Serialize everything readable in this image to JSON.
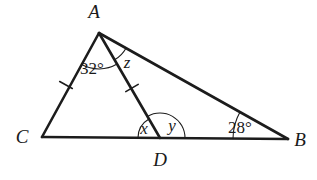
{
  "figure": {
    "type": "geometry-diagram",
    "background_color": "#ffffff",
    "stroke_color": "#1c1c1c",
    "vertices": [
      {
        "id": "A",
        "label": "A",
        "x": 99,
        "y": 33,
        "label_x": 94,
        "label_y": 18
      },
      {
        "id": "C",
        "label": "C",
        "x": 42,
        "y": 137,
        "label_x": 22,
        "label_y": 143
      },
      {
        "id": "D",
        "label": "D",
        "x": 160,
        "y": 138,
        "label_x": 153,
        "label_y": 166
      },
      {
        "id": "B",
        "label": "B",
        "x": 288,
        "y": 139,
        "label_x": 297,
        "label_y": 146
      }
    ],
    "segments": [
      {
        "id": "CA",
        "from": "C",
        "to": "A",
        "stroke_width": 2.6,
        "tick_marks": 1
      },
      {
        "id": "AD",
        "from": "A",
        "to": "D",
        "stroke_width": 2.6,
        "tick_marks": 1
      },
      {
        "id": "AB",
        "from": "A",
        "to": "B",
        "stroke_width": 2.6,
        "tick_marks": 0
      },
      {
        "id": "CB",
        "from": "C",
        "to": "B",
        "stroke_width": 2.6,
        "tick_marks": 0
      }
    ],
    "tick_marks": [
      {
        "id": "tick-ca",
        "on_segment": "CA",
        "x": 66,
        "y": 85
      },
      {
        "id": "tick-ad",
        "on_segment": "AD",
        "x": 132,
        "y": 88
      }
    ],
    "angles": [
      {
        "id": "angle-CAD",
        "label": "32°",
        "vertex": "A",
        "label_x": 92,
        "label_y": 74,
        "arc_radius": 36,
        "known": true
      },
      {
        "id": "angle-DAB",
        "label": "z",
        "vertex": "A",
        "label_x": 127,
        "label_y": 68,
        "arc_radius": 31,
        "known": false
      },
      {
        "id": "angle-ADC",
        "label": "x",
        "vertex": "D",
        "label_x": 142,
        "label_y": 134,
        "arc_radius": 22,
        "known": false
      },
      {
        "id": "angle-ADB",
        "label": "y",
        "vertex": "D",
        "label_x": 171,
        "label_y": 131,
        "arc_radius": 25,
        "known": false
      },
      {
        "id": "angle-ABC",
        "label": "28°",
        "vertex": "B",
        "label_x": 237,
        "label_y": 133,
        "arc_radius": 55,
        "known": true
      }
    ]
  }
}
